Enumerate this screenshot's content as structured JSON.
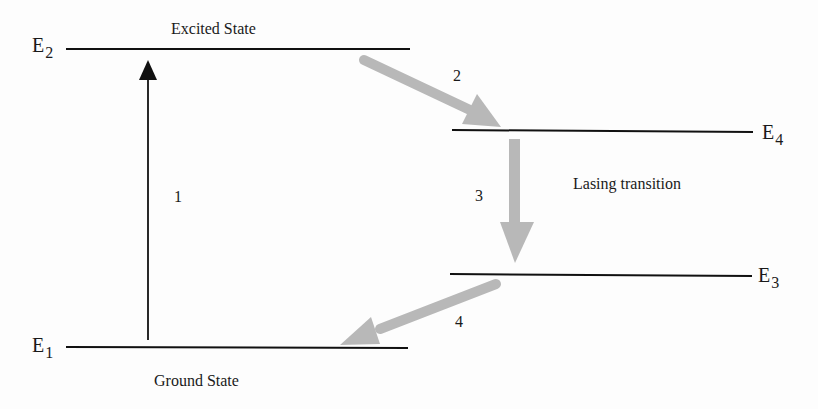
{
  "diagram": {
    "levels": [
      {
        "id": "E1",
        "label": "E",
        "sub": "1",
        "state_label": "Ground State"
      },
      {
        "id": "E2",
        "label": "E",
        "sub": "2",
        "state_label": "Excited State"
      },
      {
        "id": "E3",
        "label": "E",
        "sub": "3"
      },
      {
        "id": "E4",
        "label": "E",
        "sub": "4"
      }
    ],
    "transitions": [
      {
        "number": "1",
        "from": "E1",
        "to": "E2",
        "color": "#111111"
      },
      {
        "number": "2",
        "from": "E2",
        "to": "E4",
        "color": "#b8b8b8"
      },
      {
        "number": "3",
        "from": "E4",
        "to": "E3",
        "color": "#b8b8b8",
        "label": "Lasing transition"
      },
      {
        "number": "4",
        "from": "E3",
        "to": "E1",
        "color": "#b8b8b8"
      }
    ],
    "colors": {
      "line": "#111111",
      "pump_arrow": "#111111",
      "gray_arrow": "#b8b8b8",
      "background": "#fdfdfd"
    }
  }
}
